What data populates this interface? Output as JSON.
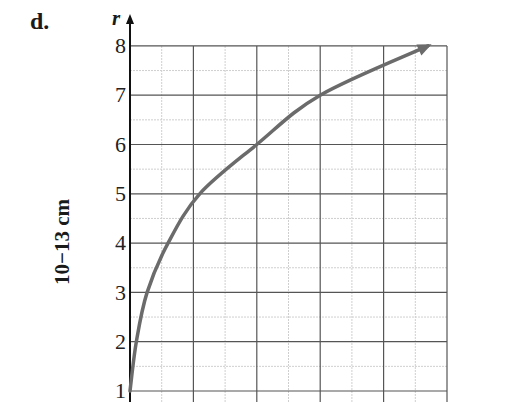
{
  "panel_label": "d.",
  "chart_data": {
    "type": "line",
    "title": "",
    "xlabel": "",
    "ylabel": "10−13 cm",
    "y_axis_symbol": "r",
    "yticks": [
      1,
      2,
      3,
      4,
      5,
      6,
      7,
      8
    ],
    "ylim": [
      1,
      8
    ],
    "xlim": [
      0,
      5
    ],
    "x_tick_labels": [],
    "grid": true,
    "series": [
      {
        "name": "r",
        "color": "#6b6b6b",
        "x": [
          0,
          0.1,
          0.27,
          0.6,
          1.1,
          2.0,
          3.0,
          4.7
        ],
        "values": [
          1,
          2,
          3,
          4,
          5,
          6,
          7,
          8
        ],
        "arrow_end": true
      }
    ]
  }
}
